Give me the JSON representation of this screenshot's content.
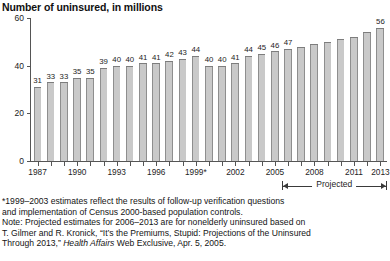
{
  "chart_data": {
    "type": "bar",
    "title": "Number of uninsured, in millions",
    "xlabel": "",
    "ylabel": "",
    "ylim": [
      0,
      60
    ],
    "yticks": [
      0,
      20,
      40,
      60
    ],
    "grid": false,
    "legend": null,
    "categories": [
      "1987",
      "1988",
      "1989",
      "1990",
      "1991",
      "1992",
      "1993",
      "1994",
      "1995",
      "1996",
      "1997",
      "1998",
      "1999*",
      "2000",
      "2001",
      "2002",
      "2003",
      "2004",
      "2005",
      "2006",
      "2007",
      "2008",
      "2009",
      "2010",
      "2011",
      "2012",
      "2013"
    ],
    "xtick_labels": [
      "1987",
      "1990",
      "1993",
      "1996",
      "1999*",
      "2002",
      "2005",
      "2008",
      "2011",
      "2013"
    ],
    "values": [
      31,
      33,
      33,
      35,
      35,
      39,
      40,
      40,
      41,
      41,
      42,
      43,
      44,
      40,
      40,
      41,
      44,
      45,
      46,
      47,
      48,
      49,
      50,
      51,
      52,
      54,
      56
    ],
    "point_labels": [
      "31",
      "33",
      "33",
      "35",
      "35",
      "39",
      "40",
      "40",
      "41",
      "41",
      "42",
      "43",
      "44",
      "40",
      "40",
      "41",
      "44",
      "45",
      "46",
      "47",
      "",
      "",
      "",
      "",
      "",
      "",
      "56"
    ],
    "annotations": [
      {
        "text": "Projected",
        "from_category": "2006",
        "to_category": "2013"
      }
    ],
    "bar_color": "#c9c9c9",
    "bar_edge_color": "#8e8e8e"
  },
  "notes": {
    "line1": "*1999–2003 estimates reflect the results of follow-up verification questions",
    "line2": "and implementation of Census 2000-based population controls.",
    "line3": "Note: Projected estimates for 2006–2013 are for nonelderly uninsured based on",
    "line4_a": "T. Gilmer and R. Kronick, “It’s the Premiums, Stupid: Projections of the Uninsured",
    "line5_a": "Through 2013,” ",
    "line5_italic": "Health Affairs",
    "line5_b": " Web Exclusive, Apr. 5, 2005."
  }
}
